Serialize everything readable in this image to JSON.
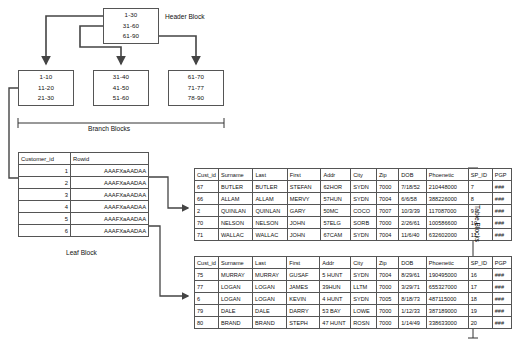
{
  "diagram": {
    "header_block": {
      "label": "Header Block",
      "lines": [
        "1-30",
        "31-60",
        "61-90"
      ]
    },
    "branch_blocks": {
      "label": "Branch Blocks",
      "blocks": [
        {
          "lines": [
            "1-10",
            "11-20",
            "21-30"
          ]
        },
        {
          "lines": [
            "31-40",
            "41-50",
            "51-60"
          ]
        },
        {
          "lines": [
            "61-70",
            "71-77",
            "78-90"
          ]
        }
      ]
    },
    "leaf_block": {
      "label": "Leaf Block",
      "columns": [
        "Customer_id",
        "Rowid"
      ],
      "rows": [
        [
          "1",
          "AAAFXaAADAA"
        ],
        [
          "2",
          "AAAFXaAADAA"
        ],
        [
          "3",
          "AAAFXaAADAA"
        ],
        [
          "4",
          "AAAFXaAADAA"
        ],
        [
          "5",
          "AAAFXaAADAA"
        ],
        [
          "6",
          "AAAFXaAADAA"
        ]
      ]
    },
    "table_blocks": {
      "label": "Table Blocks",
      "columns": [
        "Cust_id",
        "Surname",
        "Last",
        "First",
        "Addr",
        "City",
        "Zip",
        "DOB",
        "Phoenetic",
        "SP_ID",
        "PGP"
      ],
      "blocks": [
        {
          "rows": [
            [
              "67",
              "BUTLER",
              "BUTLER",
              "STEFAN",
              "62HOR",
              "SYDN",
              "7000",
              "7/18/52",
              "210448000",
              "7",
              "###"
            ],
            [
              "66",
              "ALLAM",
              "ALLAM",
              "MERVY",
              "57HUN",
              "SYDN",
              "7004",
              "6/6/58",
              "388226000",
              "8",
              "###"
            ],
            [
              "2",
              "QUINLAN",
              "QUINLAN",
              "GARY",
              "50MC",
              "COCO",
              "7007",
              "10/3/39",
              "117087000",
              "9",
              "###"
            ],
            [
              "70",
              "NELSON",
              "NELSON",
              "JOHN",
              "57ELG",
              "SORB",
              "7000",
              "2/26/61",
              "100586600",
              "10",
              "###"
            ],
            [
              "71",
              "WALLAC",
              "WALLAC",
              "JOHN",
              "67CAM",
              "SYDN",
              "7004",
              "11/6/40",
              "632602000",
              "11",
              "###"
            ]
          ]
        },
        {
          "rows": [
            [
              "75",
              "MURRAY",
              "MURRAY",
              "GUSAF",
              "5 HUNT",
              "SYDN",
              "7004",
              "8/29/61",
              "190495000",
              "16",
              "###"
            ],
            [
              "77",
              "LOGAN",
              "LOGAN",
              "JAMES",
              "39HUN",
              "LLTM",
              "7000",
              "3/29/71",
              "655327000",
              "17",
              "###"
            ],
            [
              "6",
              "LOGAN",
              "LOGAN",
              "KEVIN",
              "4 HUNT",
              "SYDN",
              "7005",
              "8/18/73",
              "487115000",
              "18",
              "###"
            ],
            [
              "79",
              "DALE",
              "DALE",
              "DARRY",
              "53 BAY",
              "LOWE",
              "7000",
              "1/12/33",
              "387189000",
              "19",
              "###"
            ],
            [
              "80",
              "BRAND",
              "BRAND",
              "STEPH",
              "47 HUNT",
              "ROSN",
              "7000",
              "1/14/49",
              "338633000",
              "20",
              "###"
            ]
          ]
        }
      ]
    },
    "colors": {
      "line": "#555555",
      "border": "#555555",
      "text": "#111111",
      "background": "#ffffff"
    }
  }
}
